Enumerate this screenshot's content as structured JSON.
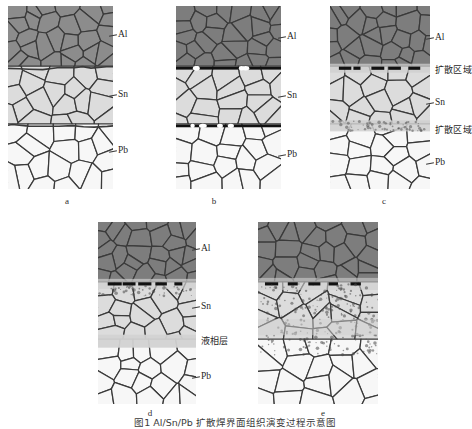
{
  "figure": {
    "caption": "图1  Al/Sn/Pb 扩散焊界面组织演变过程示意图",
    "panels": [
      {
        "id": "a",
        "letter": "a",
        "letter_x": 57,
        "letter_y": 196,
        "x": 8,
        "y": 6,
        "width": 105,
        "height": 183,
        "state": "initial-contact",
        "interfaces": "thin-wavy",
        "labels": [
          {
            "text": "Al",
            "x": 118,
            "y": 30,
            "type": "latin",
            "leader": true
          },
          {
            "text": "Sn",
            "x": 118,
            "y": 90,
            "type": "latin",
            "leader": true
          },
          {
            "text": "Pb",
            "x": 118,
            "y": 146,
            "type": "latin",
            "leader": true
          }
        ]
      },
      {
        "id": "b",
        "letter": "b",
        "letter_x": 204,
        "letter_y": 196,
        "x": 176,
        "y": 6,
        "width": 105,
        "height": 183,
        "state": "pressure-bonded",
        "interfaces": "thick-dark",
        "labels": [
          {
            "text": "Al",
            "x": 287,
            "y": 32,
            "type": "latin",
            "leader": true
          },
          {
            "text": "Sn",
            "x": 287,
            "y": 91,
            "type": "latin",
            "leader": true
          },
          {
            "text": "Pb",
            "x": 287,
            "y": 150,
            "type": "latin",
            "leader": true
          }
        ]
      },
      {
        "id": "c",
        "letter": "c",
        "letter_x": 374,
        "letter_y": 196,
        "x": 330,
        "y": 6,
        "width": 100,
        "height": 183,
        "state": "diffusion-zones-formed",
        "interfaces": "dashes-and-band",
        "labels": [
          {
            "text": "Al",
            "x": 435,
            "y": 33,
            "type": "latin",
            "leader": true
          },
          {
            "text": "扩散区域",
            "x": 435,
            "y": 66,
            "type": "cjk",
            "leader": false
          },
          {
            "text": "Sn",
            "x": 435,
            "y": 98,
            "type": "latin",
            "leader": true
          },
          {
            "text": "扩散区域",
            "x": 435,
            "y": 126,
            "type": "cjk",
            "leader": false
          },
          {
            "text": "Pb",
            "x": 435,
            "y": 158,
            "type": "latin",
            "leader": true
          }
        ]
      },
      {
        "id": "d",
        "letter": "d",
        "letter_x": 140,
        "letter_y": 408,
        "x": 98,
        "y": 222,
        "width": 98,
        "height": 182,
        "state": "liquid-phase-formed",
        "interfaces": "dashes-and-liquid-band",
        "labels": [
          {
            "text": "Al",
            "x": 201,
            "y": 244,
            "type": "latin",
            "leader": true
          },
          {
            "text": "Sn",
            "x": 201,
            "y": 302,
            "type": "latin",
            "leader": true
          },
          {
            "text": "液相层",
            "x": 201,
            "y": 337,
            "type": "cjk",
            "leader": false
          },
          {
            "text": "Pb",
            "x": 201,
            "y": 372,
            "type": "latin",
            "leader": true
          }
        ]
      },
      {
        "id": "e",
        "letter": "e",
        "letter_x": 313,
        "letter_y": 408,
        "x": 258,
        "y": 222,
        "width": 120,
        "height": 182,
        "state": "fully-mixed-joint",
        "interfaces": "speckled-mixed-zone",
        "labels": []
      }
    ],
    "layers": [
      {
        "name": "Al",
        "fill": "#8c8c8c",
        "role": "aluminium-layer"
      },
      {
        "name": "Sn",
        "fill": "#dcdcdc",
        "role": "tin-layer"
      },
      {
        "name": "Pb",
        "fill": "#f6f6f6",
        "role": "lead-layer"
      }
    ],
    "colors": {
      "grain_stroke": "#3a3a3a",
      "al_fill": "#8c8c8c",
      "al_fill_dark": "#7d7d7d",
      "sn_fill": "#dcdcdc",
      "pb_fill": "#f7f7f7",
      "interface_dark": "#111111",
      "diffusion_band": "#cfcfcf",
      "liquid_band": "#d2d2d2",
      "background": "#ffffff",
      "text": "#1f1f1f"
    }
  }
}
